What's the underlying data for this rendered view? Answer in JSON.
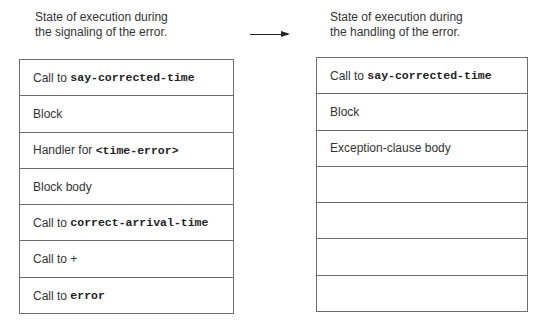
{
  "left_panel": {
    "caption": [
      "State of execution during",
      "the signaling of the error."
    ],
    "frames": [
      {
        "prefix": "Call to ",
        "code": "say-corrected-time"
      },
      {
        "prefix": "Block",
        "code": ""
      },
      {
        "prefix": "Handler for ",
        "code": "<time-error>"
      },
      {
        "prefix": "Block body",
        "code": ""
      },
      {
        "prefix": "Call to ",
        "code": "correct-arrival-time"
      },
      {
        "prefix": "Call to +",
        "code": ""
      },
      {
        "prefix": "Call to ",
        "code": "error"
      }
    ]
  },
  "arrow": {
    "direction": "right",
    "icon": "arrow-right-icon"
  },
  "right_panel": {
    "caption": [
      "State of execution during",
      "the handling of the error."
    ],
    "frames": [
      {
        "prefix": "Call to ",
        "code": "say-corrected-time"
      },
      {
        "prefix": "Block",
        "code": ""
      },
      {
        "prefix": "Exception-clause body",
        "code": ""
      },
      {
        "prefix": "",
        "code": ""
      },
      {
        "prefix": "",
        "code": ""
      },
      {
        "prefix": "",
        "code": ""
      },
      {
        "prefix": "",
        "code": ""
      }
    ]
  }
}
